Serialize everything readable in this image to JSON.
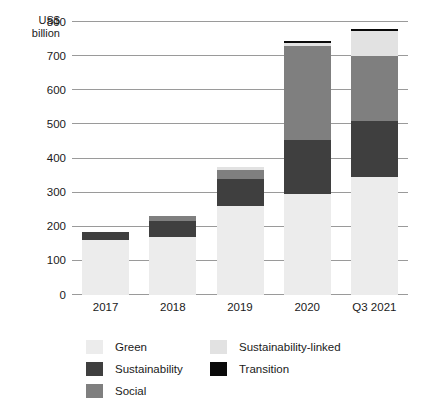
{
  "chart_data": {
    "type": "bar",
    "stacked": true,
    "title": "",
    "subtitle": "",
    "xlabel": "",
    "ylabel": "US$\nbillion",
    "ylim": [
      0,
      800
    ],
    "ytick_values": [
      0,
      100,
      200,
      300,
      400,
      500,
      600,
      700,
      800
    ],
    "ytick_labels": [
      "0",
      "100",
      "200",
      "300",
      "400",
      "500",
      "600",
      "700",
      "800"
    ],
    "grid": true,
    "legend_position": "bottom",
    "categories": [
      "2017",
      "2018",
      "2019",
      "2020",
      "Q3 2021"
    ],
    "series": [
      {
        "name": "Green",
        "color": "#ececec",
        "pattern": "dotted",
        "values": [
          160,
          170,
          260,
          297,
          345
        ]
      },
      {
        "name": "Sustainability",
        "color": "#3f3f3f",
        "pattern": "solid",
        "values": [
          25,
          48,
          80,
          158,
          165
        ]
      },
      {
        "name": "Social",
        "color": "#7f7f7f",
        "pattern": "solid",
        "values": [
          0,
          14,
          25,
          274,
          190
        ]
      },
      {
        "name": "Sustainability-linked",
        "color": "#e2e2e2",
        "pattern": "solid",
        "values": [
          0,
          0,
          11,
          9,
          75
        ]
      },
      {
        "name": "Transition",
        "color": "#0a0a0a",
        "pattern": "solid",
        "values": [
          0,
          0,
          0,
          5,
          5
        ]
      }
    ],
    "totals": [
      185,
      232,
      376,
      743,
      780
    ]
  },
  "legend": {
    "left_column": [
      {
        "label": "Green",
        "swatch": "green-swatch"
      },
      {
        "label": "Sustainability",
        "swatch": "sustainability-swatch"
      },
      {
        "label": "Social",
        "swatch": "social-swatch"
      }
    ],
    "right_column": [
      {
        "label": "Sustainability-linked",
        "swatch": "sustainability-linked-swatch"
      },
      {
        "label": "Transition",
        "swatch": "transition-swatch"
      }
    ]
  }
}
